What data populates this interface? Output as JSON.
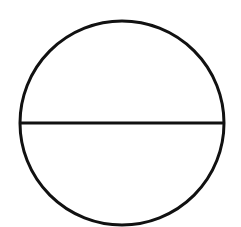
{
  "diagram": {
    "background": "#ffffff",
    "stroke_color": "#111111",
    "stroke_width": 3,
    "circle": {
      "cx": 122,
      "cy": 123,
      "r": 102
    },
    "diameter": {
      "x1": 20,
      "y1": 123,
      "x2": 224,
      "y2": 123
    }
  }
}
